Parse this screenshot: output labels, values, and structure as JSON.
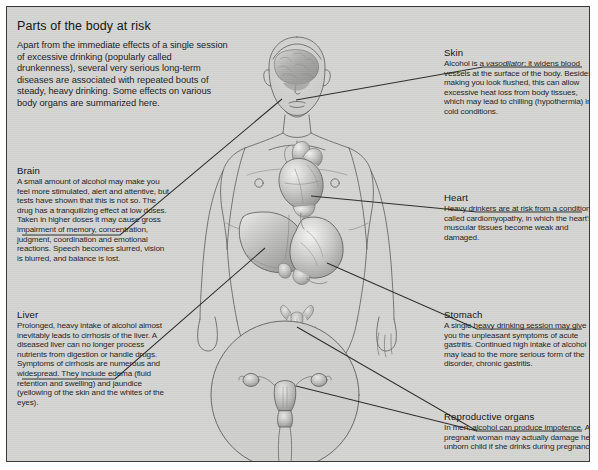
{
  "figure": {
    "title": "Parts of the body at risk",
    "intro": "Apart from the immediate effects of a single session of excessive drinking (popularly called drunkenness), several very serious long-term diseases are associated with repeated bouts of steady, heavy drinking. Some effects on various body organs are summarized here.",
    "background_color": "#d4d4d2",
    "border_color": "#3a3a3a",
    "leader_line_color": "#2a2a2a"
  },
  "labels": {
    "brain": {
      "heading": "Brain",
      "body": "A small amount of alcohol may make you feel more stimulated, alert and attentive, but tests have shown that this is not so. The drug has a tranquilizing effect at low doses. Taken in higher doses it may cause gross impairment of memory, concentration, judgment, coordination and emotional reactions. Speech becomes slurred, vision is blurred, and balance is lost."
    },
    "liver": {
      "heading": "Liver",
      "body": "Prolonged, heavy intake of alcohol almost inevitably leads to cirrhosis of the liver. A diseased liver can no longer process nutrients from digestion or handle drugs. Symptoms of cirrhosis are numerous and widespread. They include edema (fluid retention and swelling) and jaundice (yellowing of the skin and the whites of the eyes)."
    },
    "skin": {
      "heading": "Skin",
      "body_before": "Alcohol is a ",
      "body_italic": "vasodilator",
      "body_after": "; it widens blood vessels at the surface of the body. Besides making you look flushed, this can allow excessive heat loss from body tissues, which may lead to chilling (hypothermia) in cold conditions."
    },
    "heart": {
      "heading": "Heart",
      "body": "Heavy drinkers are at risk from a condition called cardiomyopathy, in which the heart's muscular tissues become weak and damaged."
    },
    "stomach": {
      "heading": "Stomach",
      "body": "A single heavy drinking session may give you the unpleasant symptoms of acute gastritis. Continued high intake of alcohol may lead to the more serious form of the disorder, chronic gastritis."
    },
    "reproductive": {
      "heading": "Reproductive organs",
      "body": "In men, alcohol can produce impotence. A pregnant woman may actually damage her unborn child if she drinks during pregnancy."
    }
  },
  "illustration": {
    "figure_description": "front-view human body line drawing with shaded internal organs",
    "organs": [
      "brain",
      "heart",
      "liver",
      "stomach",
      "male-reproductive-organs",
      "female-reproductive-organs"
    ],
    "inset": "circular magnified inset of female reproductive organs"
  }
}
